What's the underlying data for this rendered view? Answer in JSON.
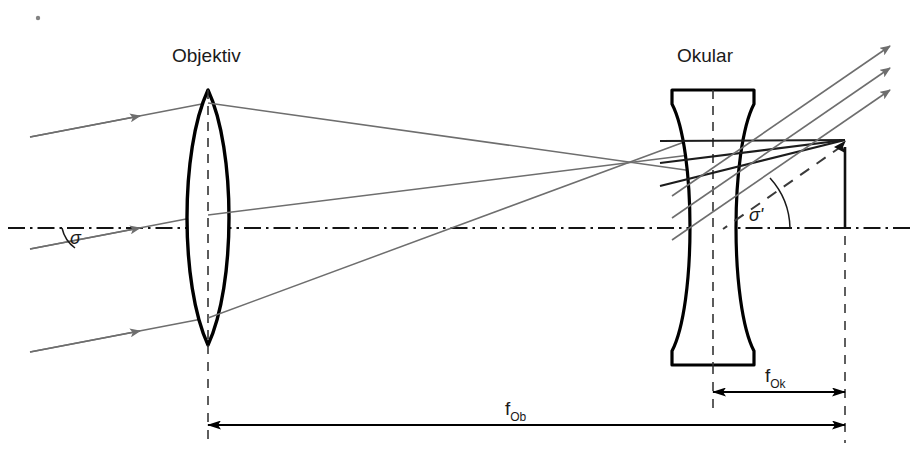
{
  "figure": {
    "labels": {
      "objective": "Objektiv",
      "ocular": "Okular",
      "angle_in": "σ",
      "angle_out": "σ'",
      "focal_objective_main": "f",
      "focal_objective_sub": "Ob",
      "focal_ocular_main": "f",
      "focal_ocular_sub": "Ok"
    },
    "colors": {
      "ray": "#6e6e6e",
      "lens_outline": "#000000",
      "axis": "#141414",
      "dimension": "#000000",
      "construction_dash": "#3a3a3a",
      "background": "#ffffff",
      "text": "#1a1a1a"
    },
    "geometry": {
      "optical_axis_y": 228,
      "objective_center_x": 208,
      "ocular_center_x": 713,
      "image_point_x": 845,
      "image_point_y": 140,
      "f_ob_dimension_y": 425,
      "f_ok_dimension_y": 392,
      "objective_lens_type": "biconvex",
      "ocular_lens_type": "biconcave",
      "incoming_ray_count": 3,
      "outgoing_ray_count": 3
    }
  }
}
